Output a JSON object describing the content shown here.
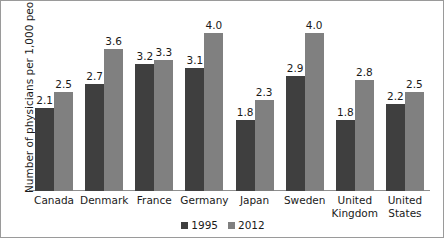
{
  "chart_data": {
    "type": "bar",
    "title": "",
    "xlabel": "",
    "ylabel": "Number of physicians per 1,000 people",
    "ylim": [
      0,
      4.6
    ],
    "grid": false,
    "legend_position": "bottom",
    "categories": [
      "Canada",
      "Denmark",
      "France",
      "Germany",
      "Japan",
      "Sweden",
      "United Kingdom",
      "United States"
    ],
    "series": [
      {
        "name": "1995",
        "color": "#3f3f3f",
        "values": [
          2.1,
          2.7,
          3.2,
          3.1,
          1.8,
          2.9,
          1.8,
          2.2
        ],
        "labels": [
          "2.1",
          "2.7",
          "3.2",
          "3.1",
          "1.8",
          "2.9",
          "1.8",
          "2.2"
        ]
      },
      {
        "name": "2012",
        "color": "#808080",
        "values": [
          2.5,
          3.6,
          3.3,
          4.0,
          2.3,
          4.0,
          2.8,
          2.5
        ],
        "labels": [
          "2.5",
          "3.6",
          "3.3",
          "4.0",
          "2.3",
          "4.0",
          "2.8",
          "2.5"
        ]
      }
    ]
  },
  "legend": {
    "items": [
      {
        "label": "1995",
        "color": "#3f3f3f"
      },
      {
        "label": "2012",
        "color": "#808080"
      }
    ]
  },
  "axis": {
    "y_title": "Number of physicians per 1,000 people"
  }
}
